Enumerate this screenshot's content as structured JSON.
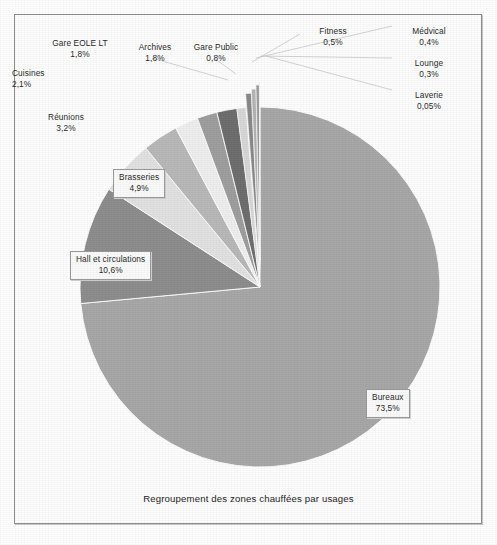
{
  "chart_data": {
    "type": "pie",
    "title": "Regroupement des zones chauffées par usages",
    "xlabel": "",
    "ylabel": "",
    "grid": false,
    "legend_position": "none",
    "value_unit": "%",
    "decimal_separator": ",",
    "total": "100%",
    "categories": [
      "Bureaux",
      "Hall et circulations",
      "Brasseries",
      "Réunions",
      "Cuisines",
      "Gare EOLE LT",
      "Archives",
      "Gare Public",
      "Fitness",
      "Médvical",
      "Lounge",
      "Laverie"
    ],
    "values": [
      73.5,
      10.6,
      4.9,
      3.2,
      2.1,
      1.8,
      1.8,
      0.8,
      0.5,
      0.4,
      0.3,
      0.05
    ],
    "value_labels": [
      "73,5%",
      "10,6%",
      "4,9%",
      "3,2%",
      "2,1%",
      "1,8%",
      "1,8%",
      "0,8%",
      "0,5%",
      "0,4%",
      "0,3%",
      "0,05%"
    ],
    "colors": [
      "#a8a8a8",
      "#8e8e8e",
      "#e2e2e2",
      "#b9b9b9",
      "#efefef",
      "#9f9f9f",
      "#6f6f6f",
      "#d8d8d8",
      "#8a8a8a",
      "#b4b4b4",
      "#9c9c9c",
      "#c6c6c6"
    ]
  },
  "slices": [
    {
      "name": "Bureaux",
      "value_label": "73,5%"
    },
    {
      "name": "Hall et circulations",
      "value_label": "10,6%"
    },
    {
      "name": "Brasseries",
      "value_label": "4,9%"
    },
    {
      "name": "Réunions",
      "value_label": "3,2%"
    },
    {
      "name": "Cuisines",
      "value_label": "2,1%"
    },
    {
      "name": "Gare EOLE LT",
      "value_label": "1,8%"
    },
    {
      "name": "Archives",
      "value_label": "1,8%"
    },
    {
      "name": "Gare Public",
      "value_label": "0,8%"
    },
    {
      "name": "Fitness",
      "value_label": "0,5%"
    },
    {
      "name": "Médvical",
      "value_label": "0,4%"
    },
    {
      "name": "Lounge",
      "value_label": "0,3%"
    },
    {
      "name": "Laverie",
      "value_label": "0,05%"
    }
  ]
}
